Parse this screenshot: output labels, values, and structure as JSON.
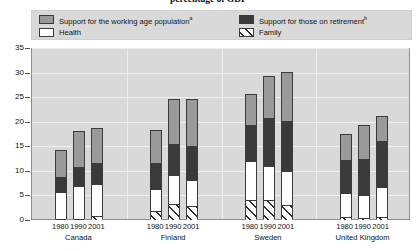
{
  "title": "percentage of GDP",
  "legend": {
    "position": "top",
    "items": [
      {
        "key": "working",
        "label": "Support for the working age population",
        "note": "a",
        "color": "#9a9a9a",
        "icon": "legend-swatch-working-age"
      },
      {
        "key": "retirement",
        "label": "Support for those on retirement",
        "note": "b",
        "color": "#3a3a3a",
        "icon": "legend-swatch-retirement"
      },
      {
        "key": "health",
        "label": "Health",
        "note": "",
        "color": "#ffffff",
        "icon": "legend-swatch-health"
      },
      {
        "key": "family",
        "label": "Family",
        "note": "",
        "color": "#ffffff",
        "icon": "legend-swatch-family"
      }
    ]
  },
  "yaxis": {
    "ticks": [
      "0",
      "5",
      "10",
      "15",
      "20",
      "25",
      "30",
      "35"
    ],
    "min": 0,
    "max": 35,
    "step": 5
  },
  "groups": [
    {
      "country": "Canada",
      "years": [
        "1980",
        "1990",
        "2001"
      ]
    },
    {
      "country": "Finland",
      "years": [
        "1980",
        "1990",
        "2001"
      ]
    },
    {
      "country": "Sweden",
      "years": [
        "1980",
        "1990",
        "2001"
      ]
    },
    {
      "country": "United Kingdom",
      "years": [
        "1980",
        "1990",
        "2001"
      ]
    }
  ],
  "chart_data": {
    "type": "bar",
    "subtype": "stacked-grouped-column",
    "title": "percentage of GDP",
    "xlabel": "",
    "ylabel": "",
    "ylim": [
      0,
      35
    ],
    "ytick_step": 5,
    "grid": true,
    "legend_position": "top",
    "categories": [
      "Canada 1980",
      "Canada 1990",
      "Canada 2001",
      "Finland 1980",
      "Finland 1990",
      "Finland 2001",
      "Sweden 1980",
      "Sweden 1990",
      "Sweden 2001",
      "United Kingdom 1980",
      "United Kingdom 1990",
      "United Kingdom 2001"
    ],
    "stack_order_bottom_to_top": [
      "Family",
      "Health",
      "Support for those on retirement",
      "Support for the working age population"
    ],
    "series": [
      {
        "name": "Family",
        "color": "#ffffff",
        "hatch": "diagonal",
        "values": [
          0.2,
          0.2,
          0.8,
          1.8,
          3.3,
          2.9,
          4.1,
          4.1,
          3.0,
          0.6,
          0.5,
          0.6
        ]
      },
      {
        "name": "Health",
        "color": "#ffffff",
        "values": [
          5.4,
          6.8,
          6.5,
          4.6,
          5.8,
          5.2,
          8.0,
          6.8,
          6.9,
          4.8,
          4.6,
          6.2
        ]
      },
      {
        "name": "Support for those on retirement",
        "color": "#3a3a3a",
        "values": [
          3.2,
          3.7,
          4.3,
          5.2,
          6.4,
          7.0,
          7.3,
          9.8,
          10.3,
          6.8,
          7.4,
          9.2
        ]
      },
      {
        "name": "Support for the working age population",
        "color": "#9a9a9a",
        "values": [
          5.2,
          7.3,
          7.0,
          6.5,
          9.0,
          9.4,
          6.0,
          8.4,
          9.7,
          5.2,
          6.6,
          5.0
        ]
      }
    ],
    "totals": [
      14.0,
      18.0,
      18.6,
      18.1,
      24.5,
      24.5,
      25.4,
      29.1,
      29.9,
      17.4,
      19.1,
      21.0
    ]
  }
}
